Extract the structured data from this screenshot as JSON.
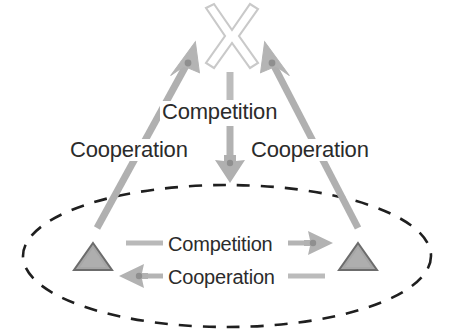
{
  "diagram": {
    "colors": {
      "background": "#ffffff",
      "text": "#2b2b2b",
      "arrow_gray": "#a8a8a8",
      "arrow_gray_dark": "#9a9a9a",
      "cross_outline": "#c9c9c9",
      "triangle_fill": "#a6a6a6",
      "triangle_outline": "#6e6e6e",
      "ellipse_dash": "#1f1f1f"
    },
    "nodes": {
      "cross": {
        "icon": "cross-x-icon",
        "shape": "outlined-x",
        "cx": 230,
        "cy": 38
      },
      "triangle_left": {
        "icon": "triangle-icon",
        "shape": "filled-triangle",
        "cx": 93,
        "cy": 258
      },
      "triangle_right": {
        "icon": "triangle-icon",
        "shape": "filled-triangle",
        "cx": 358,
        "cy": 258
      },
      "group_boundary": {
        "icon": "dashed-ellipse-icon",
        "shape": "dashed-ellipse",
        "cx": 227,
        "cy": 256,
        "rx": 205,
        "ry": 72
      }
    },
    "edges": {
      "left_diagonal": {
        "label": "Cooperation",
        "direction": "up-right",
        "from": "triangle_left",
        "to": "cross"
      },
      "right_diagonal": {
        "label": "Cooperation",
        "direction": "up-left",
        "from": "triangle_right",
        "to": "cross"
      },
      "vertical": {
        "label": "Competition",
        "direction": "down",
        "from": "cross",
        "to": "group_boundary"
      },
      "inner_top": {
        "label": "Competition",
        "direction": "right",
        "from": "triangle_left",
        "to": "triangle_right"
      },
      "inner_bottom": {
        "label": "Cooperation",
        "direction": "left",
        "from": "triangle_right",
        "to": "triangle_left"
      }
    },
    "labels": {
      "competition_top": "Competition",
      "cooperation_left": "Cooperation",
      "cooperation_right": "Cooperation",
      "competition_inner": "Competition",
      "cooperation_inner": "Cooperation"
    }
  }
}
